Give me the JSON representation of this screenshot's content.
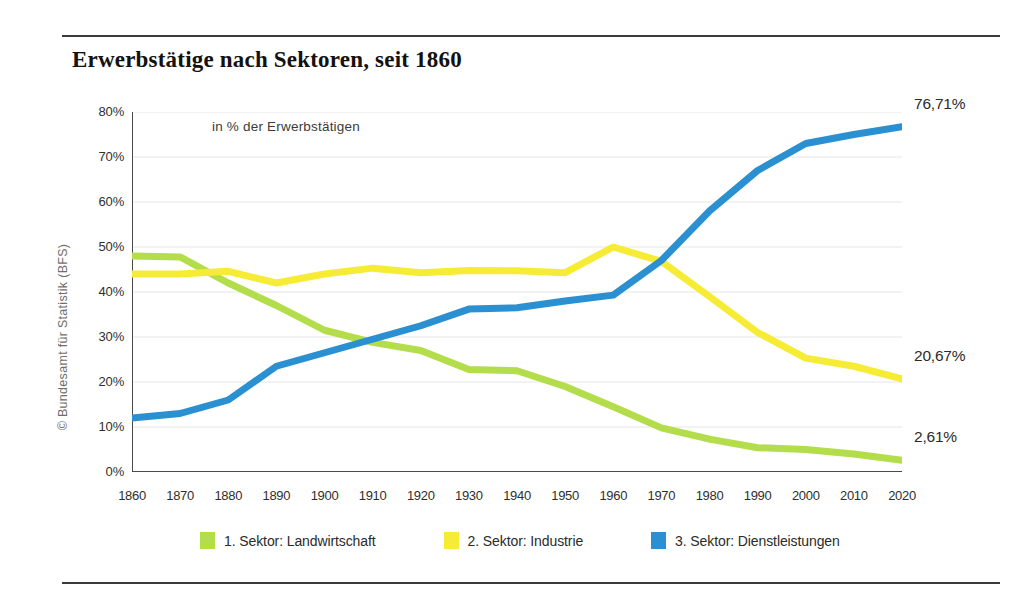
{
  "header": {
    "title": "Erwerbstätige nach Sektoren, seit 1860"
  },
  "source_note": "© Bundesamt für Statistik (BFS)",
  "legend": {
    "items": [
      {
        "label": "1. Sektor: Landwirtschaft",
        "color": "#b3dd4b",
        "swatch_name": "legend-swatch-sector1"
      },
      {
        "label": "2. Sektor: Industrie",
        "color": "#f6ec36",
        "swatch_name": "legend-swatch-sector2"
      },
      {
        "label": "3. Sektor: Dienstleistungen",
        "color": "#2a90d2",
        "swatch_name": "legend-swatch-sector3"
      }
    ]
  },
  "end_labels": [
    {
      "text": "76,71%",
      "series": "3. Sektor: Dienstleistungen"
    },
    {
      "text": "20,67%",
      "series": "2. Sektor: Industrie"
    },
    {
      "text": "2,61%",
      "series": "1. Sektor: Landwirtschaft"
    }
  ],
  "axis": {
    "y_ticks": [
      "80%",
      "70%",
      "60%",
      "50%",
      "40%",
      "30%",
      "20%",
      "10%",
      "0%"
    ],
    "x_ticks": [
      "1860",
      "1870",
      "1880",
      "1890",
      "1900",
      "1910",
      "1920",
      "1930",
      "1940",
      "1950",
      "1960",
      "1970",
      "1980",
      "1990",
      "2000",
      "2010",
      "2020"
    ]
  },
  "chart_data": {
    "type": "line",
    "title": "Erwerbstätige nach Sektoren, seit 1860",
    "subtitle": "in % der Erwerbstätigen",
    "xlabel": "",
    "ylabel": "in % der Erwerbstätigen",
    "ylim": [
      0,
      80
    ],
    "ytick_step": 10,
    "grid": true,
    "legend_position": "bottom",
    "x": [
      1860,
      1870,
      1880,
      1890,
      1900,
      1910,
      1920,
      1930,
      1940,
      1950,
      1960,
      1970,
      1980,
      1990,
      2000,
      2010,
      2020
    ],
    "series": [
      {
        "name": "1. Sektor: Landwirtschaft",
        "color": "#b3dd4b",
        "end_label": "2,61%",
        "values": [
          48.0,
          47.8,
          42.0,
          37.0,
          31.5,
          28.8,
          27.0,
          22.8,
          22.5,
          19.0,
          14.5,
          9.8,
          7.3,
          5.4,
          5.0,
          4.0,
          2.61
        ]
      },
      {
        "name": "2. Sektor: Industrie",
        "color": "#f6ec36",
        "end_label": "20,67%",
        "values": [
          44.0,
          44.0,
          44.6,
          42.0,
          44.0,
          45.3,
          44.3,
          44.8,
          44.7,
          44.3,
          50.0,
          46.8,
          39.0,
          31.0,
          25.3,
          23.5,
          20.67
        ]
      },
      {
        "name": "3. Sektor: Dienstleistungen",
        "color": "#2a90d2",
        "end_label": "76,71%",
        "values": [
          12.0,
          13.0,
          16.0,
          23.5,
          26.5,
          29.5,
          32.5,
          36.2,
          36.5,
          38.0,
          39.3,
          47.0,
          58.0,
          67.0,
          73.0,
          75.0,
          76.71
        ]
      }
    ]
  }
}
